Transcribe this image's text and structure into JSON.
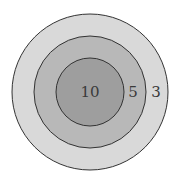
{
  "diagram": {
    "type": "target",
    "center": {
      "x": 90,
      "y": 92
    },
    "rings": [
      {
        "name": "outer",
        "radius": 78,
        "fill": "#d9d9d9",
        "score": "3",
        "label_x": 158
      },
      {
        "name": "middle",
        "radius": 56,
        "fill": "#b8b8b8",
        "score": "5",
        "label_x": 133
      },
      {
        "name": "inner",
        "radius": 34,
        "fill": "#9e9e9e",
        "score": "10",
        "label_x": 90
      }
    ],
    "stroke_color": "#333333"
  }
}
